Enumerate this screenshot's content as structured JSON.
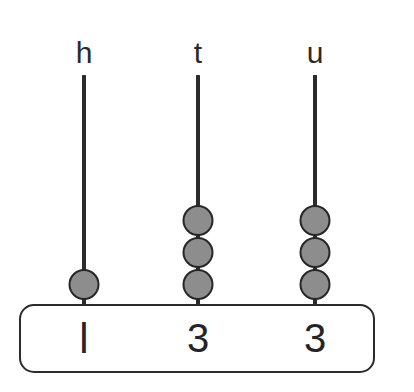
{
  "diagram": {
    "type": "place-value-abacus",
    "colors": {
      "background": "#ffffff",
      "rod": "#2b2b2b",
      "bead_fill": "#8d8d8d",
      "bead_outline": "#272727",
      "box_border": "#2b2b2b",
      "text": "#252525"
    },
    "columns": [
      {
        "id": "hundreds",
        "label": "h",
        "bead_count": 1,
        "digit": "l",
        "center_x": 84,
        "label_x": 84,
        "label_y": 38,
        "rod_top": 75,
        "rod_height": 231,
        "beads_y": [
          269
        ]
      },
      {
        "id": "tens",
        "label": "t",
        "bead_count": 3,
        "digit": "3",
        "center_x": 198,
        "label_x": 198,
        "label_y": 38,
        "rod_top": 75,
        "rod_height": 231,
        "beads_y": [
          205,
          237,
          269
        ]
      },
      {
        "id": "units",
        "label": "u",
        "bead_count": 3,
        "digit": "3",
        "center_x": 315,
        "label_x": 315,
        "label_y": 38,
        "rod_top": 75,
        "rod_height": 231,
        "beads_y": [
          205,
          237,
          269
        ]
      }
    ],
    "answer_box": {
      "value": "133",
      "left": 19,
      "top": 304,
      "width": 356,
      "height": 69
    }
  }
}
